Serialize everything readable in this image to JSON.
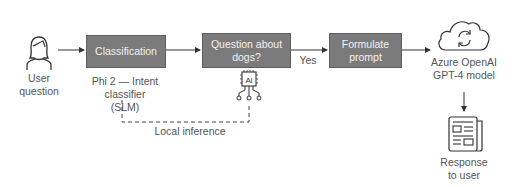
{
  "diagram": {
    "nodes": {
      "user": {
        "label_line1": "User",
        "label_line2": "question",
        "icon": "person-icon"
      },
      "classification": {
        "label": "Classification",
        "caption_line1": "Phi 2 — Intent classifier",
        "caption_line2": "(SLM)"
      },
      "question_dogs": {
        "label_line1": "Question about",
        "label_line2": "dogs?",
        "icon": "ai-chip-icon"
      },
      "formulate": {
        "label_line1": "Formulate",
        "label_line2": "prompt"
      },
      "azure": {
        "label_line1": "Azure OpenAI",
        "label_line2": "GPT-4 model",
        "icon": "cloud-sync-icon"
      },
      "response": {
        "label_line1": "Response",
        "label_line2": "to user",
        "icon": "newspaper-icon"
      }
    },
    "edges": {
      "yes_label": "Yes",
      "local_inference_label": "Local inference"
    },
    "colors": {
      "box_fill": "#7b7b7b",
      "box_text": "#f2f2f2",
      "line": "#333333"
    }
  }
}
